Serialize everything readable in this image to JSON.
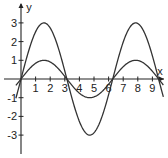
{
  "chart_data": {
    "type": "line",
    "title": "",
    "xlabel": "x",
    "ylabel": "y",
    "xlim": [
      -0.3,
      9.8
    ],
    "ylim": [
      -4.0,
      4.0
    ],
    "grid": false,
    "legend": null,
    "x_ticks": [
      1,
      2,
      3,
      4,
      5,
      6,
      7,
      8,
      9
    ],
    "y_ticks": [
      -3,
      -2,
      -1,
      1,
      2,
      3
    ],
    "series": [
      {
        "name": "y = 3 sin x",
        "function": "3*sin(x)",
        "amplitude": 3,
        "x_range": [
          -0.35,
          9.75
        ],
        "key_points": [
          {
            "x": 0,
            "y": 0
          },
          {
            "x": 1.57,
            "y": 3
          },
          {
            "x": 3.14,
            "y": 0
          },
          {
            "x": 4.71,
            "y": -3
          },
          {
            "x": 6.28,
            "y": 0
          },
          {
            "x": 7.85,
            "y": 3
          },
          {
            "x": 9.42,
            "y": 0
          }
        ]
      },
      {
        "name": "y = sin x",
        "function": "sin(x)",
        "amplitude": 1,
        "x_range": [
          -0.35,
          9.75
        ],
        "key_points": [
          {
            "x": 0,
            "y": 0
          },
          {
            "x": 1.57,
            "y": 1
          },
          {
            "x": 3.14,
            "y": 0
          },
          {
            "x": 4.71,
            "y": -1
          },
          {
            "x": 6.28,
            "y": 0
          },
          {
            "x": 7.85,
            "y": 1
          },
          {
            "x": 9.42,
            "y": 0
          }
        ]
      }
    ]
  },
  "colors": {
    "curve": "#333333",
    "axis": "#222222",
    "background": "#ffffff"
  },
  "layout": {
    "origin_px": [
      21,
      79
    ],
    "px_per_x": 14.6,
    "px_per_y": 18.7
  }
}
